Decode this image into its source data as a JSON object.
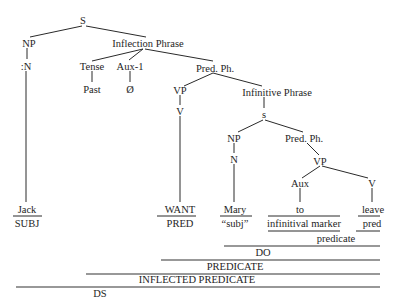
{
  "diagram": {
    "type": "syntax-tree",
    "faint_header": "",
    "nodes": {
      "s_root": "S",
      "np_subject": "NP",
      "n_subject": ":N",
      "inflection_phrase": "Inflection Phrase",
      "tense": "Tense",
      "past": "Past",
      "aux1": "Aux-1",
      "null_aux": "Ø",
      "pred_ph_main": "Pred. Ph.",
      "vp_main": "VP",
      "v_main": "V",
      "infinitive_phrase": "Infinitive Phrase",
      "s_inner": "s",
      "np_inner": "NP",
      "n_inner": "N",
      "pred_ph_inner": "Pred. Ph.",
      "vp_inner": "VP",
      "aux_inner": "Aux",
      "v_inner": "V"
    },
    "leaves": [
      {
        "word": "Jack",
        "gloss": "SUBJ"
      },
      {
        "word": "WANT",
        "gloss": "PRED"
      },
      {
        "word": "Mary",
        "gloss": "“subj”"
      },
      {
        "word": "to",
        "gloss": "infinitival marker"
      },
      {
        "word": "leave",
        "gloss": "pred"
      }
    ],
    "brackets": [
      {
        "label": "predicate"
      },
      {
        "label": "DO"
      },
      {
        "label": "PREDICATE"
      },
      {
        "label": "INFLECTED PREDICATE"
      },
      {
        "label": "DS"
      }
    ]
  }
}
